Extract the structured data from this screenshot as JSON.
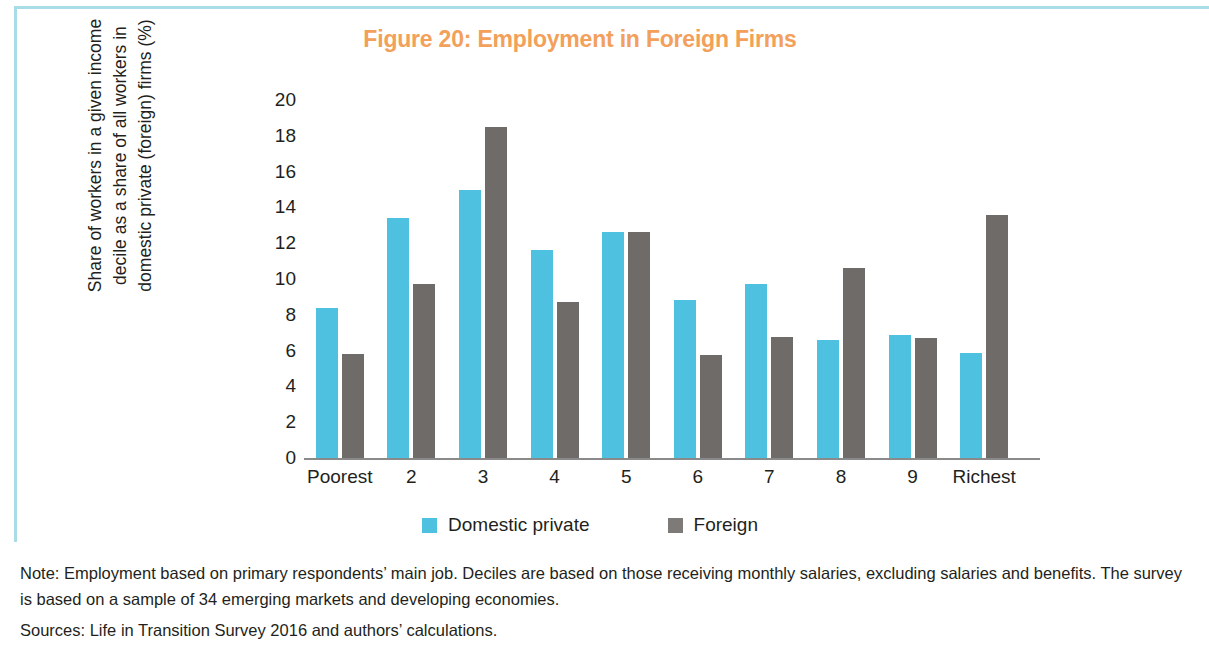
{
  "figure": {
    "title": "Figure 20: Employment in Foreign Firms",
    "title_color": "#f2a05a",
    "border_color": "#a8dce6"
  },
  "footnotes": {
    "note": "Note: Employment based on primary respondents’ main job. Deciles are based on those receiving monthly salaries, excluding salaries and benefits. The survey is based on a sample of 34 emerging markets and developing economies.",
    "sources": "Sources: Life in Transition Survey 2016 and authors’ calculations."
  },
  "chart_data": {
    "type": "bar",
    "title": "Figure 20: Employment in Foreign Firms",
    "xlabel": "",
    "ylabel": "Share of workers in a given income decile as a share of all workers in domestic private (foreign) firms (%)",
    "ylabel_lines": [
      "Share of workers in a given income",
      "decile as a share of all workers in",
      "domestic private (foreign) firms (%)"
    ],
    "categories": [
      "Poorest",
      "2",
      "3",
      "4",
      "5",
      "6",
      "7",
      "8",
      "9",
      "Richest"
    ],
    "series": [
      {
        "name": "Domestic private",
        "color": "#4fc1e0",
        "values": [
          8.4,
          13.4,
          15.0,
          11.6,
          12.65,
          8.8,
          9.7,
          6.6,
          6.9,
          5.85
        ]
      },
      {
        "name": "Foreign",
        "color": "#6e6b68",
        "values": [
          5.8,
          9.7,
          18.5,
          8.7,
          12.65,
          5.75,
          6.75,
          10.6,
          6.7,
          13.55
        ]
      }
    ],
    "ylim": [
      0,
      20
    ],
    "yticks": [
      0,
      2,
      4,
      6,
      8,
      10,
      12,
      14,
      16,
      18,
      20
    ],
    "grid": false,
    "legend_position": "bottom"
  }
}
